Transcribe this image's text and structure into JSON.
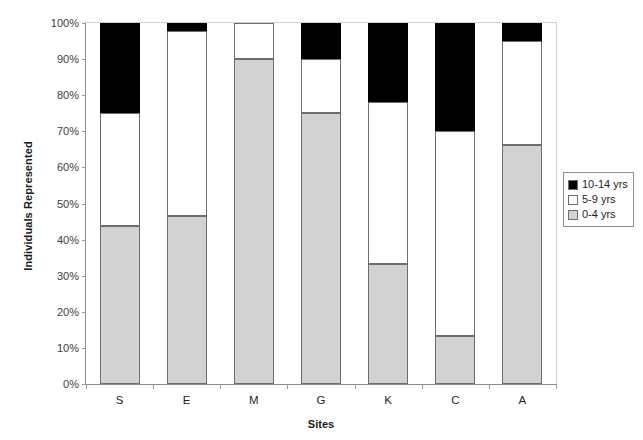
{
  "chart_data": {
    "type": "bar",
    "subtype": "stacked-bar-100-percent",
    "title": "",
    "xlabel": "Sites",
    "ylabel": "Individuals Represented",
    "categories": [
      "S",
      "E",
      "M",
      "G",
      "K",
      "C",
      "A"
    ],
    "ylim": [
      0,
      100
    ],
    "ytick_labels": [
      "0%",
      "10%",
      "20%",
      "30%",
      "40%",
      "50%",
      "60%",
      "70%",
      "80%",
      "90%",
      "100%"
    ],
    "ytick_values": [
      0,
      10,
      20,
      30,
      40,
      50,
      60,
      70,
      80,
      90,
      100
    ],
    "grid": false,
    "legend_position": "right",
    "series": [
      {
        "name": "0-4 yrs",
        "color": "#d2d2d2",
        "values": [
          43.8,
          46.5,
          90.0,
          75.0,
          33.3,
          13.3,
          66.3
        ]
      },
      {
        "name": "5-9 yrs",
        "color": "#ffffff",
        "values": [
          31.2,
          51.3,
          10.0,
          15.0,
          44.7,
          56.7,
          28.7
        ]
      },
      {
        "name": "10-14 yrs",
        "color": "#000000",
        "values": [
          25.0,
          2.2,
          0.0,
          10.0,
          22.0,
          30.0,
          5.0
        ]
      }
    ],
    "cumulative_tops": {
      "0-4 yrs": [
        43.8,
        46.5,
        90.0,
        75.0,
        33.3,
        13.3,
        66.3
      ],
      "5-9 yrs": [
        75.0,
        97.8,
        100.0,
        90.0,
        78.0,
        70.0,
        95.0
      ],
      "10-14 yrs": [
        100.0,
        100.0,
        100.0,
        100.0,
        100.0,
        100.0,
        100.0
      ]
    }
  },
  "legend": {
    "items": [
      {
        "label": "10-14 yrs",
        "color": "#000000"
      },
      {
        "label": "5-9 yrs",
        "color": "#ffffff"
      },
      {
        "label": "0-4 yrs",
        "color": "#d2d2d2"
      }
    ]
  },
  "axes": {
    "y_title": "Individuals Represented",
    "x_title": "Sites"
  }
}
